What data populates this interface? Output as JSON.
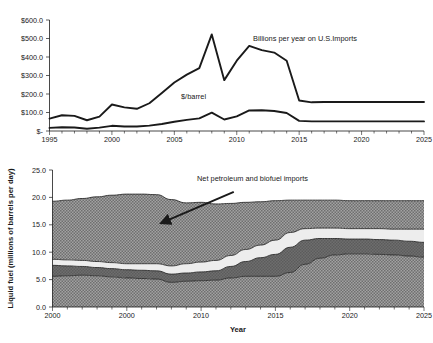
{
  "figure": {
    "background": "#ffffff",
    "ink": "#1a1a1a"
  },
  "chart_data": [
    {
      "type": "line",
      "id": "import-cost-chart",
      "title": "",
      "xlabel": "",
      "ylabel": "",
      "xlim": [
        1995,
        2025
      ],
      "ylim": [
        0,
        600
      ],
      "grid": false,
      "legend_position": "inline-annotation",
      "xticks": [
        1995,
        2000,
        2005,
        2010,
        2015,
        2020,
        2025
      ],
      "xticklabels": [
        "1995",
        "2000",
        "2005",
        "2010",
        "2015",
        "2020",
        "2025"
      ],
      "yticks": [
        0,
        100,
        200,
        300,
        400,
        500,
        600
      ],
      "yticklabels": [
        "$-",
        "$100.0",
        "$200.0",
        "$300.0",
        "$400.0",
        "$500.0",
        "$600.0"
      ],
      "minor_xtick_interval": 1,
      "x": [
        1995,
        1996,
        1997,
        1998,
        1999,
        2000,
        2001,
        2002,
        2003,
        2004,
        2005,
        2006,
        2007,
        2008,
        2009,
        2010,
        2011,
        2012,
        2013,
        2014,
        2015,
        2016,
        2017,
        2018,
        2019,
        2020,
        2021,
        2022,
        2023,
        2024,
        2025
      ],
      "series": [
        {
          "name": "Billions per year on U.S.Imports",
          "units": "billions of dollars per year",
          "values": [
            67,
            85,
            82,
            58,
            78,
            143,
            128,
            120,
            150,
            205,
            262,
            305,
            340,
            522,
            275,
            380,
            460,
            437,
            424,
            380,
            165,
            155,
            157,
            157,
            157,
            157,
            157,
            157,
            157,
            157,
            157
          ]
        },
        {
          "name": "$/barrel",
          "units": "dollars per barrel",
          "values": [
            17,
            20,
            19,
            12,
            18,
            28,
            24,
            24,
            29,
            38,
            50,
            60,
            68,
            99,
            62,
            79,
            111,
            112,
            108,
            97,
            55,
            52,
            52,
            52,
            52,
            52,
            52,
            52,
            52,
            52,
            52
          ]
        }
      ],
      "annotations": [
        {
          "text": "Billions per year on U.S.Imports",
          "x": 2012.6,
          "y": 455
        },
        {
          "text": "$/barrel",
          "x": 2006.7,
          "y": 148
        }
      ]
    },
    {
      "type": "area",
      "id": "liquid-fuel-supply-chart",
      "title": "",
      "xlabel": "Year",
      "ylabel": "Liquid fuel (millions of barrels per day)",
      "xlim": [
        2000,
        2025
      ],
      "ylim": [
        0,
        25
      ],
      "grid": false,
      "stacked": true,
      "legend_position": "inline-annotation",
      "xticks": [
        2000,
        2005,
        2010,
        2015,
        2020,
        2025
      ],
      "xticklabels": [
        "2000",
        "2000",
        "2010",
        "2015",
        "2020",
        "2025"
      ],
      "yticks": [
        0,
        5,
        10,
        15,
        20,
        25
      ],
      "yticklabels": [
        "0.0",
        "5.0",
        "10.0",
        "15.0",
        "20.0",
        "25.0"
      ],
      "minor_xtick_interval": 1,
      "x": [
        2000,
        2001,
        2002,
        2003,
        2004,
        2005,
        2006,
        2007,
        2008,
        2009,
        2010,
        2011,
        2012,
        2013,
        2014,
        2015,
        2016,
        2017,
        2018,
        2019,
        2020,
        2021,
        2022,
        2023,
        2024,
        2025
      ],
      "boundaries": [
        {
          "name": "band-1-upper",
          "values": [
            5.6,
            5.7,
            5.8,
            5.7,
            5.5,
            5.3,
            5.2,
            5.1,
            4.5,
            4.7,
            4.8,
            4.9,
            5.3,
            5.6,
            5.6,
            5.6,
            6.3,
            7.8,
            8.9,
            9.5,
            9.7,
            9.7,
            9.6,
            9.5,
            9.3,
            9.1
          ]
        },
        {
          "name": "band-2-upper",
          "values": [
            7.6,
            7.5,
            7.4,
            7.2,
            7.0,
            6.8,
            6.7,
            6.6,
            6.0,
            6.2,
            6.4,
            6.6,
            7.4,
            8.3,
            9.0,
            9.6,
            10.9,
            12.2,
            12.5,
            12.5,
            12.4,
            12.4,
            12.3,
            12.2,
            12.0,
            11.8
          ]
        },
        {
          "name": "band-3-upper",
          "values": [
            8.7,
            8.6,
            8.5,
            8.3,
            8.1,
            7.9,
            7.9,
            7.9,
            7.5,
            7.9,
            8.2,
            8.5,
            9.4,
            10.5,
            11.3,
            12.2,
            13.6,
            14.3,
            14.4,
            14.4,
            14.3,
            14.3,
            14.3,
            14.2,
            14.2,
            14.2
          ]
        },
        {
          "name": "band-4-upper",
          "values": [
            19.3,
            19.5,
            19.8,
            20.1,
            20.4,
            20.6,
            20.6,
            20.5,
            19.6,
            19.0,
            19.1,
            18.8,
            18.9,
            19.1,
            19.2,
            19.4,
            19.5,
            19.5,
            19.5,
            19.5,
            19.4,
            19.4,
            19.4,
            19.4,
            19.4,
            19.4
          ]
        }
      ],
      "bands": [
        {
          "name": "band-1",
          "fill": "#8a8a8a",
          "pattern": "dotted-medium"
        },
        {
          "name": "band-2",
          "fill": "#6e6e6e",
          "pattern": "solid-dark"
        },
        {
          "name": "band-3",
          "fill": "#ececec",
          "pattern": "light"
        },
        {
          "name": "band-4",
          "fill": "#8a8a8a",
          "pattern": "dotted-medium"
        }
      ],
      "annotations": [
        {
          "text": "Net petroleum and biofuel imports",
          "x": 2013.0,
          "y": 22.2,
          "arrow_from": [
            2012.2,
            21.0
          ],
          "arrow_to": [
            2007.3,
            15.3
          ]
        }
      ]
    }
  ]
}
